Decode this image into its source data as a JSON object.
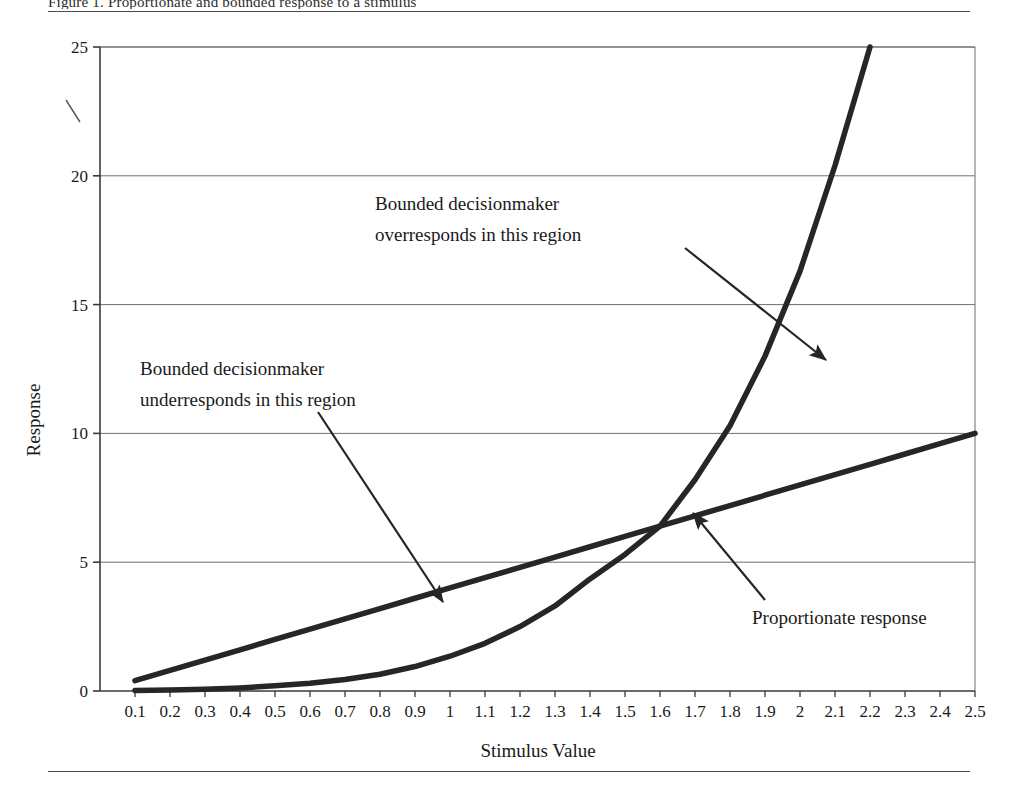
{
  "figure": {
    "caption_fragment": "Figure 1.  Proportionate and bounded response to a stimulus",
    "has_top_rule": true,
    "has_bottom_rule": true
  },
  "chart_data": {
    "type": "line",
    "title": "",
    "xlabel": "Stimulus Value",
    "ylabel": "Response",
    "xlim": [
      0,
      2.5
    ],
    "ylim": [
      0,
      25
    ],
    "grid": "horizontal",
    "xticks": [
      "0.1",
      "0.2",
      "0.3",
      "0.4",
      "0.5",
      "0.6",
      "0.7",
      "0.8",
      "0.9",
      "1",
      "1.1",
      "1.2",
      "1.3",
      "1.4",
      "1.5",
      "1.6",
      "1.7",
      "1.8",
      "1.9",
      "2",
      "2.1",
      "2.2",
      "2.3",
      "2.4",
      "2.5"
    ],
    "yticks": [
      "0",
      "5",
      "10",
      "15",
      "20",
      "25"
    ],
    "x": [
      0.1,
      0.2,
      0.3,
      0.4,
      0.5,
      0.6,
      0.7,
      0.8,
      0.9,
      1.0,
      1.1,
      1.2,
      1.3,
      1.4,
      1.5,
      1.6,
      1.7,
      1.8,
      1.9,
      2.0,
      2.1,
      2.2,
      2.3,
      2.4,
      2.5
    ],
    "series": [
      {
        "name": "Proportionate response",
        "style": "thick-line",
        "values": [
          0.4,
          0.8,
          1.2,
          1.6,
          2.0,
          2.4,
          2.8,
          3.2,
          3.6,
          4.0,
          4.4,
          4.8,
          5.2,
          5.6,
          6.0,
          6.4,
          6.8,
          7.2,
          7.6,
          8.0,
          8.4,
          8.8,
          9.2,
          9.6,
          10.0
        ]
      },
      {
        "name": "Bounded response",
        "style": "thick-curve",
        "values": [
          0.02,
          0.04,
          0.07,
          0.12,
          0.2,
          0.3,
          0.45,
          0.65,
          0.95,
          1.35,
          1.85,
          2.5,
          3.3,
          4.35,
          5.3,
          6.4,
          8.2,
          10.3,
          13.0,
          16.3,
          20.4,
          25.0,
          null,
          null,
          null
        ]
      }
    ],
    "annotations": [
      {
        "id": "over-region",
        "lines": [
          "Bounded decisionmaker",
          "overresponds in this region"
        ],
        "text_x": 375,
        "text_y": 210,
        "arrow_from": [
          685,
          248
        ],
        "arrow_to": [
          826,
          360
        ]
      },
      {
        "id": "under-region",
        "lines": [
          "Bounded decisionmaker",
          "underresponds in this region"
        ],
        "text_x": 140,
        "text_y": 375,
        "arrow_from": [
          318,
          412
        ],
        "arrow_to": [
          443,
          602
        ]
      },
      {
        "id": "proportionate-label",
        "lines": [
          "Proportionate response"
        ],
        "text_x": 752,
        "text_y": 624,
        "arrow_from": [
          765,
          600
        ],
        "arrow_to": [
          693,
          513
        ]
      }
    ],
    "colors": {
      "curve": "#262626",
      "gridline": "#6f6f6f",
      "axis": "#3a3a3a",
      "text": "#1a1a1a"
    },
    "artifact_mark": {
      "type": "stray-backslash",
      "x": 66,
      "y": 100
    }
  }
}
